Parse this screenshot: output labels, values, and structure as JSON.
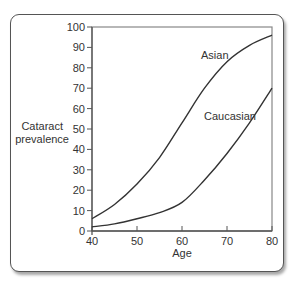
{
  "chart_data": {
    "type": "line",
    "title": "",
    "xlabel": "Age",
    "ylabel": "Cataract prevalence",
    "xlim": [
      40,
      80
    ],
    "ylim": [
      0,
      100
    ],
    "x_ticks": [
      40,
      50,
      60,
      70,
      80
    ],
    "y_ticks": [
      0,
      10,
      20,
      30,
      40,
      50,
      60,
      70,
      80,
      90,
      100
    ],
    "grid": false,
    "legend": "inline labels",
    "x": [
      40,
      45,
      50,
      55,
      60,
      65,
      70,
      75,
      80
    ],
    "series": [
      {
        "name": "Asian",
        "values": [
          6,
          13,
          23,
          36,
          53,
          70,
          83,
          91,
          96
        ]
      },
      {
        "name": "Caucasian",
        "values": [
          2,
          3.5,
          6,
          9,
          14,
          25,
          38,
          53,
          70
        ]
      }
    ],
    "annotations": [
      {
        "text": "Asian",
        "x": 66.5,
        "y": 86
      },
      {
        "text": "Caucasian",
        "x": 68,
        "y": 61
      }
    ]
  },
  "labels": {
    "ylabel_line1": "Cataract",
    "ylabel_line2": "prevalence",
    "xlabel": "Age",
    "asian": "Asian",
    "caucasian": "Caucasian"
  },
  "colors": {
    "line": "#333333",
    "axis": "#555555",
    "frame": "#555555"
  }
}
